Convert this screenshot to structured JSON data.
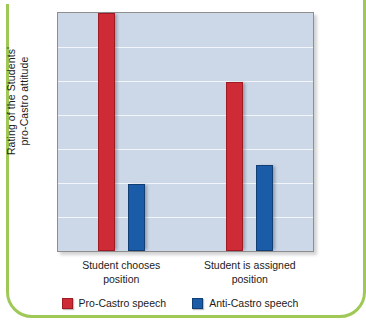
{
  "colors": {
    "pro": "#cf2b36",
    "anti": "#1a5ca8",
    "plot_background": "#ccd8e8",
    "gridline": "#f2f6fb",
    "frame": "#9fc857",
    "axis": "#8e8e8e"
  },
  "chart_data": {
    "type": "bar",
    "title": "",
    "xlabel": "",
    "ylabel": "Rating of the Students' pro-Castro attitude",
    "ylabel_line1": "Rating of the Students'",
    "ylabel_line2": "pro-Castro attitude",
    "categories": [
      "Student chooses position",
      "Student is assigned position"
    ],
    "category_lines": [
      [
        "Student chooses",
        "position"
      ],
      [
        "Student is assigned",
        "position"
      ]
    ],
    "series": [
      {
        "name": "Pro-Castro speech",
        "color": "#cf2b36",
        "values": [
          100,
          71
        ]
      },
      {
        "name": "Anti-Castro speech",
        "color": "#1a5ca8",
        "values": [
          28,
          36
        ]
      }
    ],
    "ylim": [
      0,
      100
    ],
    "y_tick_labels": [],
    "gridlines": 6,
    "grid": true,
    "legend_position": "bottom"
  },
  "legend": {
    "items": [
      {
        "label": "Pro-Castro speech"
      },
      {
        "label": "Anti-Castro speech"
      }
    ]
  }
}
